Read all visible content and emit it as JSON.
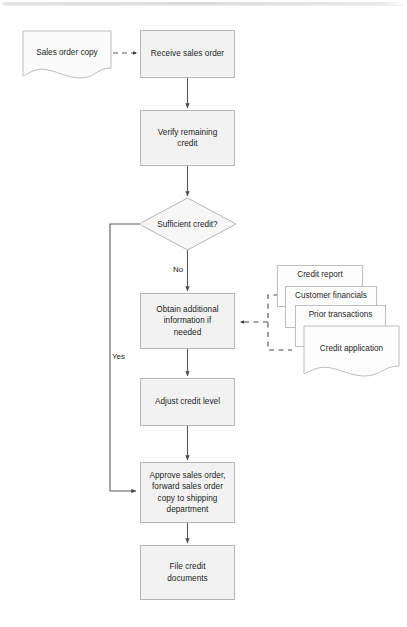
{
  "diagram": {
    "colors": {
      "node_fill": "#f2f2f2",
      "node_border": "#b6b6b6",
      "doc_fill": "#fbfbfb",
      "doc_border": "#bdbdbd",
      "connector": "#595959",
      "text": "#1d1d1d",
      "background": "#ffffff"
    },
    "nodes": {
      "sales_order_copy": "Sales order copy",
      "receive_sales_order": "Receive sales order",
      "verify_remaining_credit": "Verify remaining\ncredit",
      "sufficient_credit": "Sufficient credit?",
      "obtain_additional_information": "Obtain additional\ninformation if\nneeded",
      "adjust_credit_level": "Adjust credit level",
      "approve_sales_order": "Approve sales order,\nforward sales order\ncopy to shipping\ndepartment",
      "file_credit_documents": "File credit\ndocuments"
    },
    "source_documents": [
      "Credit report",
      "Customer financials",
      "Prior transactions",
      "Credit application"
    ],
    "edge_labels": {
      "no": "No",
      "yes": "Yes"
    }
  }
}
